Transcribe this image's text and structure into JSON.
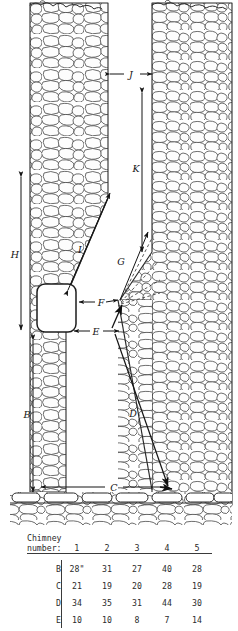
{
  "figure": {
    "ink_color": "#1b1b1b",
    "callouts": [
      {
        "id": "B",
        "label": "B",
        "kind": "vertical-dimension"
      },
      {
        "id": "C",
        "label": "C",
        "kind": "horizontal-dimension"
      },
      {
        "id": "D",
        "label": "D",
        "kind": "diagonal-dimension"
      },
      {
        "id": "E",
        "label": "E",
        "kind": "horizontal-leader"
      },
      {
        "id": "F",
        "label": "F",
        "kind": "horizontal-leader"
      },
      {
        "id": "G",
        "label": "G",
        "kind": "dashed-leader-fan"
      },
      {
        "id": "H",
        "label": "H",
        "kind": "vertical-dimension"
      },
      {
        "id": "I",
        "label": "I",
        "kind": "diagonal-dimension"
      },
      {
        "id": "J",
        "label": "J",
        "kind": "horizontal-dimension"
      },
      {
        "id": "K",
        "label": "K",
        "kind": "vertical-dimension"
      }
    ]
  },
  "table": {
    "header_line1": "Chimney",
    "header_line2": "number:",
    "columns": [
      "1",
      "2",
      "3",
      "4",
      "5"
    ],
    "rows": [
      {
        "label": "B",
        "values": [
          "28\"",
          "31",
          "27",
          "40",
          "28"
        ]
      },
      {
        "label": "C",
        "values": [
          "21",
          "19",
          "20",
          "28",
          "19"
        ]
      },
      {
        "label": "D",
        "values": [
          "34",
          "35",
          "31",
          "44",
          "30"
        ]
      },
      {
        "label": "E",
        "values": [
          "10",
          "10",
          "8",
          "7",
          "14"
        ]
      }
    ]
  }
}
